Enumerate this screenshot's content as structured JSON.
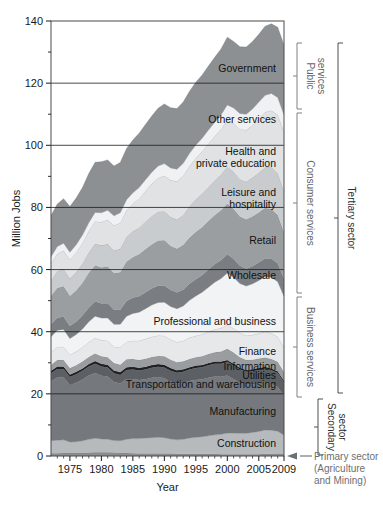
{
  "figure": {
    "title": "",
    "background_color": "#ffffff"
  },
  "chart_data": {
    "type": "area",
    "title": "",
    "xlabel": "Year",
    "ylabel": "Million Jobs",
    "xlim": [
      1972,
      2009
    ],
    "ylim": [
      0,
      140
    ],
    "grid": true,
    "legend_position": "inline-labels",
    "y_major_ticks": [
      0,
      20,
      40,
      60,
      80,
      100,
      120,
      140
    ],
    "y_minor_ticks": [
      10,
      30,
      50,
      70,
      90,
      110,
      130
    ],
    "x_tick_labels": [
      "1975",
      "1980",
      "1985",
      "1990",
      "1995",
      "2000",
      "2005",
      "2009"
    ],
    "x_tick_values": [
      1975,
      1980,
      1985,
      1990,
      1995,
      2000,
      2005,
      2009
    ],
    "x": [
      1972,
      1973,
      1974,
      1975,
      1976,
      1977,
      1978,
      1979,
      1980,
      1981,
      1982,
      1983,
      1984,
      1985,
      1986,
      1987,
      1988,
      1989,
      1990,
      1991,
      1992,
      1993,
      1994,
      1995,
      1996,
      1997,
      1998,
      1999,
      2000,
      2001,
      2002,
      2003,
      2004,
      2005,
      2006,
      2007,
      2008,
      2009
    ],
    "stack_order_bottom_to_top": [
      "Primary sector (Agriculture and Mining)",
      "Construction",
      "Manufacturing",
      "Transportation and warehousing",
      "Utilities",
      "Information",
      "Finance",
      "Professional and business",
      "Wholesale",
      "Retail",
      "Leisure and hospitality",
      "Health and private education",
      "Other services",
      "Government"
    ],
    "series": [
      {
        "name": "Primary sector (Agriculture and Mining)",
        "label": "",
        "color": "#8a8d90",
        "values": [
          0.9,
          0.9,
          1.0,
          1.0,
          1.0,
          1.0,
          1.1,
          1.2,
          1.2,
          1.2,
          1.1,
          1.0,
          1.0,
          0.9,
          0.8,
          0.8,
          0.8,
          0.8,
          0.8,
          0.8,
          0.7,
          0.7,
          0.7,
          0.7,
          0.7,
          0.7,
          0.7,
          0.6,
          0.6,
          0.6,
          0.6,
          0.6,
          0.6,
          0.6,
          0.7,
          0.7,
          0.8,
          0.7
        ]
      },
      {
        "name": "Construction",
        "label": "Construction",
        "color": "#b7babd",
        "values": [
          4.0,
          4.2,
          4.2,
          3.5,
          3.6,
          3.9,
          4.3,
          4.5,
          4.3,
          4.2,
          3.9,
          3.9,
          4.4,
          4.7,
          4.8,
          5.0,
          5.1,
          5.2,
          5.1,
          4.7,
          4.5,
          4.7,
          5.1,
          5.3,
          5.5,
          5.8,
          6.1,
          6.4,
          6.8,
          6.8,
          6.7,
          6.7,
          7.0,
          7.3,
          7.7,
          7.6,
          7.2,
          6.0
        ]
      },
      {
        "name": "Manufacturing",
        "label": "Manufacturing",
        "color": "#75797d",
        "values": [
          19.1,
          20.2,
          20.1,
          18.3,
          19.0,
          19.7,
          20.5,
          21.0,
          20.3,
          20.2,
          18.8,
          18.4,
          19.4,
          19.2,
          18.9,
          18.9,
          19.3,
          19.4,
          19.1,
          18.4,
          18.1,
          18.1,
          18.3,
          18.5,
          18.5,
          18.7,
          18.8,
          18.5,
          18.5,
          17.3,
          16.3,
          15.6,
          15.5,
          15.4,
          15.3,
          14.8,
          14.2,
          12.7
        ]
      },
      {
        "name": "Transportation and warehousing",
        "label": "Transportation and warehousing",
        "color": "#5c6064",
        "values": [
          2.6,
          2.7,
          2.7,
          2.6,
          2.7,
          2.8,
          2.9,
          3.0,
          3.0,
          2.9,
          2.8,
          2.8,
          2.9,
          3.0,
          3.0,
          3.1,
          3.2,
          3.3,
          3.5,
          3.5,
          3.5,
          3.6,
          3.7,
          3.8,
          3.9,
          4.0,
          4.1,
          4.2,
          4.4,
          4.4,
          4.2,
          4.2,
          4.2,
          4.4,
          4.5,
          4.5,
          4.5,
          4.2
        ]
      },
      {
        "name": "Utilities",
        "label": "Utilities",
        "color": "#1f2124",
        "values": [
          0.8,
          0.8,
          0.8,
          0.8,
          0.8,
          0.8,
          0.8,
          0.9,
          0.9,
          0.9,
          0.9,
          0.9,
          0.9,
          0.9,
          0.9,
          0.9,
          0.9,
          0.9,
          0.9,
          0.9,
          0.8,
          0.8,
          0.8,
          0.8,
          0.7,
          0.7,
          0.7,
          0.7,
          0.6,
          0.6,
          0.6,
          0.6,
          0.6,
          0.6,
          0.5,
          0.6,
          0.6,
          0.6
        ]
      },
      {
        "name": "Information",
        "label": "Information",
        "color": "#9a9da0",
        "values": [
          2.0,
          2.1,
          2.1,
          2.1,
          2.1,
          2.2,
          2.3,
          2.4,
          2.4,
          2.4,
          2.4,
          2.4,
          2.5,
          2.5,
          2.5,
          2.6,
          2.6,
          2.6,
          2.7,
          2.7,
          2.6,
          2.6,
          2.6,
          2.7,
          2.8,
          2.9,
          3.0,
          3.2,
          3.6,
          3.6,
          3.4,
          3.2,
          3.1,
          3.1,
          3.0,
          3.0,
          3.0,
          2.8
        ]
      },
      {
        "name": "Finance",
        "label": "Finance",
        "color": "#e6e8ea",
        "values": [
          4.0,
          4.2,
          4.3,
          4.3,
          4.4,
          4.6,
          4.8,
          5.0,
          5.2,
          5.3,
          5.3,
          5.5,
          5.7,
          5.9,
          6.2,
          6.4,
          6.5,
          6.6,
          6.6,
          6.5,
          6.5,
          6.6,
          6.9,
          6.9,
          7.1,
          7.2,
          7.4,
          7.6,
          7.7,
          7.8,
          7.8,
          7.9,
          8.0,
          8.1,
          8.4,
          8.3,
          8.1,
          7.8
        ]
      },
      {
        "name": "Professional and business",
        "label": "Professional and business",
        "color": "#f2f3f4",
        "values": [
          5.0,
          5.4,
          5.5,
          5.2,
          5.5,
          5.9,
          6.5,
          7.0,
          7.1,
          7.3,
          7.2,
          7.5,
          8.2,
          8.8,
          9.2,
          9.7,
          10.2,
          10.6,
          10.8,
          10.6,
          10.7,
          11.2,
          12.0,
          12.8,
          13.5,
          14.3,
          15.1,
          15.9,
          16.7,
          16.4,
          15.9,
          15.9,
          16.4,
          17.0,
          17.6,
          18.0,
          17.7,
          16.6
        ]
      },
      {
        "name": "Wholesale",
        "label": "Wholesale",
        "color": "#7a7e82",
        "values": [
          3.9,
          4.0,
          4.1,
          4.0,
          4.1,
          4.3,
          4.5,
          4.7,
          4.7,
          4.8,
          4.7,
          4.7,
          4.9,
          5.0,
          5.1,
          5.2,
          5.3,
          5.4,
          5.4,
          5.3,
          5.2,
          5.2,
          5.3,
          5.4,
          5.5,
          5.7,
          5.8,
          5.9,
          6.0,
          5.9,
          5.7,
          5.6,
          5.7,
          5.8,
          5.9,
          6.0,
          5.9,
          5.6
        ]
      },
      {
        "name": "Retail",
        "label": "Retail",
        "color": "#9b9ea1",
        "values": [
          9.2,
          9.6,
          9.8,
          9.7,
          10.1,
          10.5,
          11.2,
          11.6,
          11.6,
          11.8,
          11.7,
          12.0,
          12.6,
          13.1,
          13.5,
          13.9,
          14.2,
          14.5,
          14.5,
          14.2,
          14.1,
          14.4,
          14.9,
          15.2,
          15.4,
          15.6,
          15.8,
          16.1,
          16.3,
          16.1,
          15.9,
          15.8,
          16.0,
          16.1,
          16.2,
          16.0,
          15.6,
          15.0
        ]
      },
      {
        "name": "Leisure and hospitality",
        "label": "Leisure and hospitality",
        "color": "#c9ccce",
        "values": [
          5.1,
          5.4,
          5.6,
          5.6,
          5.9,
          6.2,
          6.6,
          7.0,
          7.1,
          7.2,
          7.3,
          7.6,
          8.0,
          8.3,
          8.6,
          8.9,
          9.1,
          9.3,
          9.4,
          9.3,
          9.4,
          9.7,
          10.1,
          10.5,
          10.8,
          11.0,
          11.2,
          11.5,
          11.9,
          12.0,
          11.9,
          12.2,
          12.5,
          12.8,
          13.1,
          13.4,
          13.4,
          13.1
        ]
      },
      {
        "name": "Health and private education",
        "label": "Health and private education",
        "color": "#e0e2e4",
        "values": [
          5.3,
          5.6,
          5.9,
          6.1,
          6.3,
          6.6,
          6.9,
          7.2,
          7.5,
          7.8,
          8.1,
          8.4,
          8.7,
          9.0,
          9.4,
          9.9,
          10.4,
          10.9,
          11.4,
          11.9,
          12.3,
          12.6,
          12.9,
          13.3,
          13.6,
          13.9,
          14.2,
          14.6,
          15.1,
          15.6,
          16.2,
          16.6,
          16.9,
          17.4,
          17.8,
          18.3,
          18.9,
          19.3
        ]
      },
      {
        "name": "Other services",
        "label": "Other services",
        "color": "#f0f1f2",
        "values": [
          2.2,
          2.3,
          2.4,
          2.4,
          2.5,
          2.6,
          2.7,
          2.9,
          3.0,
          3.1,
          3.1,
          3.2,
          3.3,
          3.4,
          3.5,
          3.6,
          3.7,
          3.8,
          3.9,
          3.9,
          3.9,
          4.0,
          4.1,
          4.2,
          4.3,
          4.4,
          4.5,
          4.6,
          4.8,
          4.9,
          5.0,
          5.1,
          5.2,
          5.3,
          5.4,
          5.5,
          5.5,
          5.4
        ]
      },
      {
        "name": "Government",
        "label": "Government",
        "color": "#8d9093",
        "values": [
          13.3,
          13.7,
          14.3,
          14.7,
          15.0,
          15.3,
          15.8,
          16.1,
          16.4,
          16.2,
          16.0,
          16.2,
          16.5,
          17.0,
          17.5,
          17.8,
          18.1,
          18.6,
          19.2,
          19.4,
          19.5,
          19.7,
          20.0,
          20.2,
          20.3,
          20.6,
          20.9,
          21.2,
          21.8,
          21.4,
          21.5,
          21.6,
          21.7,
          21.8,
          22.2,
          22.4,
          22.6,
          22.5
        ]
      }
    ]
  },
  "brackets": [
    {
      "id": "public-services",
      "label": "Public services",
      "tone": "light",
      "y_top": 43,
      "y_bottom": 109,
      "x": 297,
      "label_x": 307
    },
    {
      "id": "consumer-services",
      "label": "Consumer services",
      "tone": "light",
      "y_top": 113,
      "y_bottom": 293,
      "x": 297,
      "label_x": 307
    },
    {
      "id": "business-services",
      "label": "Business services",
      "tone": "light",
      "y_top": 297,
      "y_bottom": 397,
      "x": 297,
      "label_x": 307
    },
    {
      "id": "tertiary-sector",
      "label": "Tertiary sector",
      "tone": "dark",
      "y_top": 43,
      "y_bottom": 393,
      "x": 338,
      "label_x": 348
    },
    {
      "id": "secondary-sector",
      "label": "Secondary sector",
      "tone": "dark",
      "y_top": 399,
      "y_bottom": 455,
      "x": 318,
      "label_x": 328
    }
  ],
  "primary_sector_note": {
    "line1": "Primary sector",
    "line2": "(Agriculture",
    "line3": "and Mining)",
    "arrow": "←"
  }
}
